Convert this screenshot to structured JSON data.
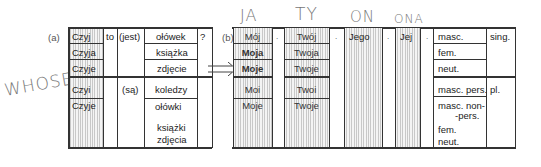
{
  "labels": {
    "a": "(a)",
    "b": "(b)",
    "question": "?"
  },
  "handwriting": {
    "whose": "WHOSE",
    "ja": "JA",
    "ty": "TY",
    "on": "ON",
    "ona": "ONA"
  },
  "table_a": {
    "czyj": [
      "Czyj",
      "Czyja",
      "Czyje",
      "Czyi",
      "Czyje"
    ],
    "to": "to",
    "jest": "(jest)",
    "sa": "(są)",
    "nouns_sing": [
      "ołówek",
      "książka",
      "zdjęcie"
    ],
    "nouns_pl": [
      "koledzy",
      "ołówki",
      "książki",
      "zdjęcia"
    ]
  },
  "table_b": {
    "moj": [
      "Mój",
      "Moja",
      "Moje",
      "Moi",
      "Moje"
    ],
    "twoj": [
      "Twój",
      "Twoja",
      "Twoje",
      "Twoi",
      "Twoje"
    ],
    "jego": "Jego",
    "jej": "Jej",
    "dot": ".",
    "genders_sing": [
      "masc.",
      "fem.",
      "neut."
    ],
    "genders_pl": [
      "masc. pers.",
      "masc. non-",
      "-pers.",
      "fem.",
      "neut."
    ],
    "number_sing": "sing.",
    "number_pl": "pl."
  }
}
